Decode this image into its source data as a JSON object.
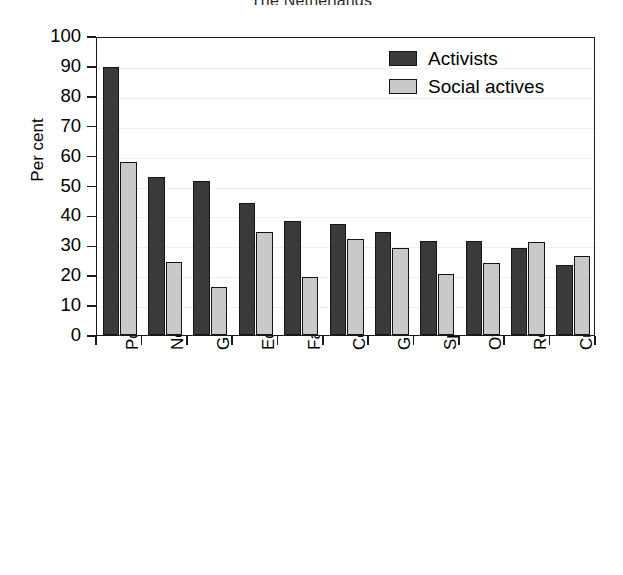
{
  "chart_data": {
    "type": "bar",
    "title": "The Netherlands",
    "xlabel": "",
    "ylabel": "Per cent",
    "ylim": [
      0,
      100
    ],
    "ytick_step": 10,
    "yticks": [
      0,
      10,
      20,
      30,
      40,
      50,
      60,
      70,
      80,
      90,
      100
    ],
    "grid": true,
    "legend_position": "top-right",
    "categories": [
      "Politics",
      "New politics",
      "Group-specific welfare",
      "Economic interest",
      "Family",
      "Community concerns",
      "General welfare",
      "Sports",
      "Other",
      "Religion",
      "Culture"
    ],
    "series": [
      {
        "name": "Activists",
        "color": "#3a3a3a",
        "values": [
          89.5,
          53,
          51.5,
          44,
          38,
          37,
          34.5,
          31.5,
          31.5,
          29,
          23.5
        ]
      },
      {
        "name": "Social actives",
        "color": "#c9c9c9",
        "values": [
          58,
          24.5,
          16,
          34.5,
          19.5,
          32,
          29,
          20.5,
          24,
          31,
          26.5
        ]
      }
    ]
  },
  "legend": {
    "items": [
      {
        "label": "Activists"
      },
      {
        "label": "Social actives"
      }
    ]
  },
  "colors": {
    "activists": "#3a3a3a",
    "social_actives": "#c9c9c9",
    "axis": "#1a1a1a",
    "grid": "#f0eeee",
    "background": "#ffffff"
  }
}
